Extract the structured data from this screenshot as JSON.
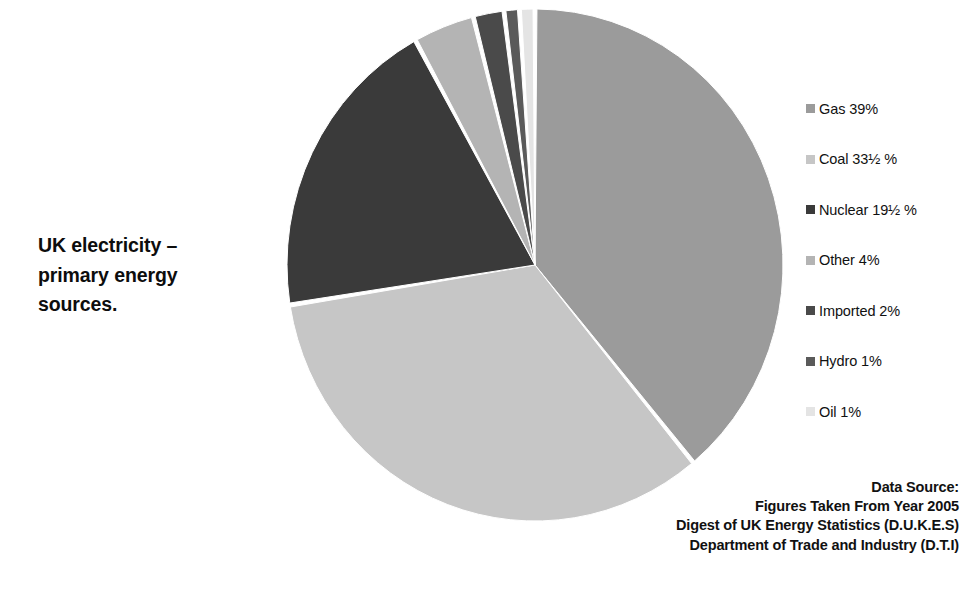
{
  "title": {
    "text": "UK electricity –\nprimary energy\nsources."
  },
  "chart_data": {
    "type": "pie",
    "title": "UK electricity – primary energy sources.",
    "unit": "%",
    "total": 100,
    "start_angle_deg": 0,
    "direction": "clockwise",
    "legend_position": "right",
    "grid": false,
    "categories": [
      "Gas",
      "Coal",
      "Nuclear",
      "Other",
      "Imported",
      "Hydro",
      "Oil"
    ],
    "values": [
      39,
      33.5,
      19.5,
      4,
      2,
      1,
      1
    ],
    "value_labels": [
      "39%",
      "33½ %",
      "19½ %",
      "4%",
      "2%",
      "1%",
      "1%"
    ],
    "colors": [
      "#9b9b9b",
      "#c6c6c6",
      "#3a3a3a",
      "#b4b4b4",
      "#4a4a4a",
      "#5a5a5a",
      "#e4e4e4"
    ],
    "slices": [
      {
        "name": "Gas",
        "value": 39,
        "label": "Gas 39%",
        "color": "#9b9b9b"
      },
      {
        "name": "Coal",
        "value": 33.5,
        "label": "Coal 33½ %",
        "color": "#c6c6c6"
      },
      {
        "name": "Nuclear",
        "value": 19.5,
        "label": "Nuclear 19½ %",
        "color": "#3a3a3a"
      },
      {
        "name": "Other",
        "value": 4,
        "label": "Other 4%",
        "color": "#b4b4b4"
      },
      {
        "name": "Imported",
        "value": 2,
        "label": "Imported 2%",
        "color": "#4a4a4a"
      },
      {
        "name": "Hydro",
        "value": 1,
        "label": "Hydro 1%",
        "color": "#5a5a5a"
      },
      {
        "name": "Oil",
        "value": 1,
        "label": "Oil 1%",
        "color": "#e4e4e4"
      }
    ]
  },
  "legend": {
    "items": [
      {
        "label": "Gas 39%",
        "color": "#9b9b9b"
      },
      {
        "label": "Coal 33½ %",
        "color": "#c6c6c6"
      },
      {
        "label": "Nuclear 19½ %",
        "color": "#3a3a3a"
      },
      {
        "label": "Other 4%",
        "color": "#b4b4b4"
      },
      {
        "label": "Imported 2%",
        "color": "#4a4a4a"
      },
      {
        "label": "Hydro 1%",
        "color": "#5a5a5a"
      },
      {
        "label": "Oil 1%",
        "color": "#e4e4e4"
      }
    ]
  },
  "source_note": {
    "text": "Data Source:\nFigures Taken From Year 2005\nDigest of UK Energy Statistics (D.U.K.E.S)\nDepartment of Trade and Industry (D.T.I)"
  },
  "geometry": {
    "center_x": 259,
    "center_y": 265,
    "radius_x": 248,
    "radius_y": 256,
    "gap_deg": 0.9,
    "edge_color": "#ffffff"
  }
}
